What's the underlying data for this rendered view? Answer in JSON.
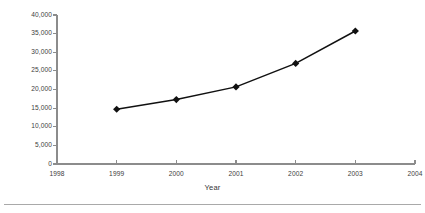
{
  "chart_data": {
    "type": "line",
    "title": "",
    "subtitle": "",
    "xlabel": "Year",
    "ylabel": "No. Vehicles Registered",
    "x": [
      1999,
      2000,
      2001,
      2002,
      2003
    ],
    "values": [
      14700,
      17300,
      20700,
      27000,
      35700
    ],
    "series": [
      {
        "name": "No. Vehicles Registered",
        "values": [
          14700,
          17300,
          20700,
          27000,
          35700
        ]
      }
    ],
    "xlim": [
      1998,
      2004
    ],
    "ylim": [
      0,
      40000
    ],
    "x_tick_labels": [
      "1998",
      "1999",
      "2000",
      "2001",
      "2002",
      "2003",
      "2004"
    ],
    "x_ticks": [
      1998,
      1999,
      2000,
      2001,
      2002,
      2003,
      2004
    ],
    "y_tick_labels": [
      "0",
      "5,000",
      "10,000",
      "15,000",
      "20,000",
      "25,000",
      "30,000",
      "35,000",
      "40,000"
    ],
    "y_ticks": [
      0,
      5000,
      10000,
      15000,
      20000,
      25000,
      30000,
      35000,
      40000
    ],
    "grid": false,
    "legend": false,
    "legend_position": "none",
    "marker": "diamond",
    "line_color": "#111111",
    "marker_color": "#111111",
    "axis_color": "#8c8c8c",
    "background_color": "#ffffff"
  },
  "figure": {
    "axis_title_y": "No. Vehicles Registered",
    "axis_title_x": "Year"
  }
}
